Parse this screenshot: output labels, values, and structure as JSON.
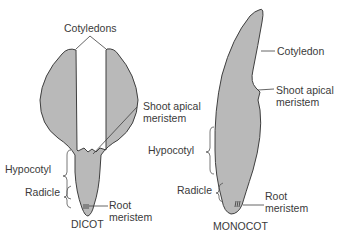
{
  "diagram": {
    "colors": {
      "tissue_fill": "#b9b9b9",
      "outline": "#3f3f3f",
      "text": "#3a3a3a",
      "background": "#ffffff"
    },
    "dicot": {
      "title": "DICOT",
      "labels": {
        "cotyledons": "Cotyledons",
        "shoot_apical_line1": "Shoot apical",
        "shoot_apical_line2": "meristem",
        "hypocotyl": "Hypocotyl",
        "radicle": "Radicle",
        "root_line1": "Root",
        "root_line2": "meristem"
      }
    },
    "monocot": {
      "title": "MONOCOT",
      "labels": {
        "cotyledon": "Cotyledon",
        "shoot_apical_line1": "Shoot apical",
        "shoot_apical_line2": "meristem",
        "hypocotyl": "Hypocotyl",
        "radicle": "Radicle",
        "root_line1": "Root",
        "root_line2": "meristem"
      }
    }
  }
}
